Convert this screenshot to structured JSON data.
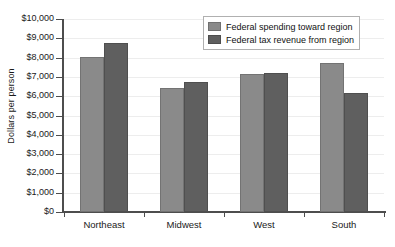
{
  "chart_data": {
    "type": "bar",
    "title": "",
    "xlabel": "",
    "ylabel": "Dollars per person",
    "categories": [
      "Northeast",
      "Midwest",
      "West",
      "South"
    ],
    "series": [
      {
        "name": "Federal spending toward region",
        "color": "#8a8a8a",
        "values": [
          8050,
          6400,
          7150,
          7700
        ]
      },
      {
        "name": "Federal tax revenue from region",
        "color": "#5f5f5f",
        "values": [
          8750,
          6750,
          7200,
          6150
        ]
      }
    ],
    "ylim": [
      0,
      10000
    ],
    "ytick_values": [
      0,
      1000,
      2000,
      3000,
      4000,
      5000,
      6000,
      7000,
      8000,
      9000,
      10000
    ],
    "ytick_labels": [
      "$0",
      "$1,000",
      "$2,000",
      "$3,000",
      "$4,000",
      "$5,000",
      "$6,000",
      "$7,000",
      "$8,000",
      "$9,000",
      "$10,000"
    ],
    "grid": true,
    "legend_position": "top-right"
  }
}
